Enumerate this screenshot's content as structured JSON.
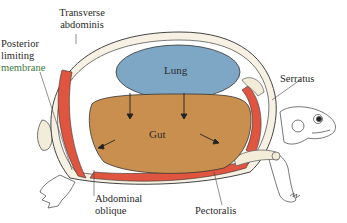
{
  "diagram": {
    "partial_caption": "(a) Inspiration",
    "colors": {
      "lung": "#7ea7c6",
      "gut": "#c98f4f",
      "muscle": "#e0553f",
      "bone": "#f2ecd9",
      "outline": "#3a3a3a"
    },
    "organs": {
      "lung": "Lung",
      "gut": "Gut"
    },
    "labels": {
      "transverse_line1": "Transverse",
      "transverse_line2": "abdominis",
      "posterior_line1": "Posterior",
      "posterior_line2": "limiting",
      "posterior_line3": "membrane",
      "serratus": "Serratus",
      "abdominal_line1": "Abdominal",
      "abdominal_line2": "oblique",
      "pectoralis": "Pectoralis"
    }
  }
}
